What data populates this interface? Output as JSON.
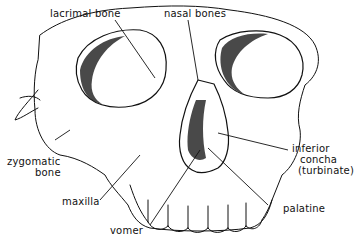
{
  "figure": {
    "labels": [
      {
        "id": "lacrimal",
        "text": "lacrimal bone"
      },
      {
        "id": "nasal",
        "text": "nasal bones"
      },
      {
        "id": "zygomatic_1",
        "text": "zygomatic"
      },
      {
        "id": "zygomatic_2",
        "text": "bone"
      },
      {
        "id": "maxilla",
        "text": "maxilla"
      },
      {
        "id": "vomer",
        "text": "vomer"
      },
      {
        "id": "concha_1",
        "text": "inferior"
      },
      {
        "id": "concha_2",
        "text": "concha"
      },
      {
        "id": "concha_3",
        "text": "(turbinate)"
      },
      {
        "id": "palatine",
        "text": "palatine"
      }
    ],
    "colors": {
      "ink": "#111111",
      "background": "#ffffff",
      "shade": "#2a2a2a"
    }
  }
}
